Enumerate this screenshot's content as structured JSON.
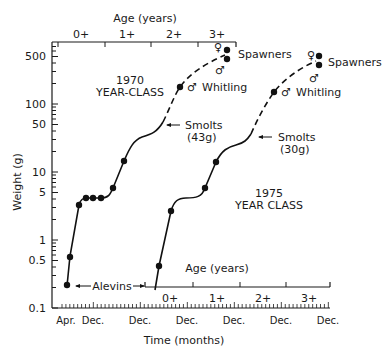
{
  "chart_data": {
    "type": "line",
    "title": "",
    "xlabel": "Time (months)",
    "ylabel": "Weight (g)",
    "yscale": "log",
    "ylim": [
      0.1,
      700
    ],
    "y_ticks": [
      {
        "value": 0.1,
        "label": "0.1"
      },
      {
        "value": 0.5,
        "label": "0.5"
      },
      {
        "value": 1,
        "label": "1"
      },
      {
        "value": 5,
        "label": "5"
      },
      {
        "value": 10,
        "label": "10"
      },
      {
        "value": 50,
        "label": "50"
      },
      {
        "value": 100,
        "label": "100"
      },
      {
        "value": 500,
        "label": "500"
      }
    ],
    "x_ticks": [
      "Apr.",
      "Dec.",
      "Dec.",
      "Dec.",
      "Dec.",
      "Dec.",
      "Dec."
    ],
    "x_units": "months since April 1970",
    "grid": false,
    "top_axis": {
      "label": "Age (years)",
      "ticks": [
        "0+",
        "1+",
        "2+",
        "3+"
      ],
      "applies_to": "1970 YEAR-CLASS"
    },
    "inner_axis": {
      "label": "Age (years)",
      "ticks": [
        "0+",
        "1+",
        "2+",
        "3+"
      ],
      "applies_to": "1975 YEAR CLASS"
    },
    "series": [
      {
        "name": "1970 YEAR-CLASS",
        "points": [
          {
            "month": 0,
            "weight": 0.22
          },
          {
            "month": 1,
            "weight": 0.58
          },
          {
            "month": 4,
            "weight": 3.3
          },
          {
            "month": 6.5,
            "weight": 4.1
          },
          {
            "month": 8.5,
            "weight": 4.1
          },
          {
            "month": 11,
            "weight": 4.1
          },
          {
            "month": 15,
            "weight": 5.8
          },
          {
            "month": 18.5,
            "weight": 14.5
          },
          {
            "month": 29,
            "weight": 43,
            "note": "Smolts (43g)",
            "marker": false
          },
          {
            "month": 32,
            "weight": 178,
            "note": "♂ Whitling"
          },
          {
            "month": 41,
            "weight": 600,
            "note": "♀ Spawners"
          },
          {
            "month": 41,
            "weight": 470,
            "note": "♂ Spawners"
          }
        ]
      },
      {
        "name": "1975 YEAR CLASS",
        "points": [
          {
            "month": 24.5,
            "weight": 0.41
          },
          {
            "month": 27.5,
            "weight": 2.7
          },
          {
            "month": 36,
            "weight": 5.8
          },
          {
            "month": 39,
            "weight": 14
          },
          {
            "month": 52,
            "weight": 30,
            "note": "Smolts (30g)",
            "marker": false
          },
          {
            "month": 55.5,
            "weight": 150,
            "note": "♂ Whitling"
          },
          {
            "month": 66,
            "weight": 510,
            "note": "♀ Spawners"
          },
          {
            "month": 66,
            "weight": 375,
            "note": "♂ Spawners"
          }
        ]
      }
    ],
    "annotations": [
      "1970 YEAR-CLASS",
      "1975 YEAR CLASS",
      "Alevins",
      "Smolts (43g)",
      "Smolts (30g)",
      "♂ Whitling",
      "Spawners",
      "♀",
      "♂"
    ]
  },
  "labels": {
    "ylabel": "Weight (g)",
    "xlabel": "Time (months)",
    "top_axis_label": "Age (years)",
    "inner_axis_label": "Age (years)",
    "y_ticks": [
      "500",
      "100",
      "50",
      "10",
      "5",
      "1",
      "0.5",
      "0.1"
    ],
    "x_ticks": [
      "Apr.",
      "Dec.",
      "Dec.",
      "Dec.",
      "Dec.",
      "Dec.",
      "Dec."
    ],
    "top_ticks": [
      "0+",
      "1+",
      "2+",
      "3+"
    ],
    "inner_ticks": [
      "0+",
      "1+",
      "2+",
      "3+"
    ],
    "class1970_line1": "1970",
    "class1970_line2": "YEAR-CLASS",
    "class1975_line1": "1975",
    "class1975_line2": "YEAR CLASS",
    "alevins": "Alevins",
    "smolts": "Smolts",
    "smolts1970_weight": "(43g)",
    "smolts1975_weight": "(30g)",
    "whitling": "Whitling",
    "spawners": "Spawners",
    "female_symbol": "♀",
    "male_symbol": "♂"
  }
}
